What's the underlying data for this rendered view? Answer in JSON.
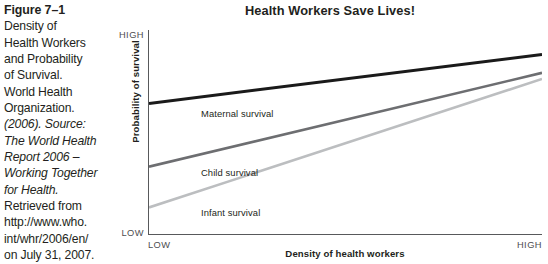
{
  "caption": {
    "figure_number": "Figure 7–1",
    "lines": [
      "Density of",
      "Health Workers",
      "and Probability",
      "of Survival.",
      "World Health",
      "Organization.",
      "(2006). Source:",
      "The World Health",
      "Report 2006 –",
      "Working Together",
      "for Health.",
      "Retrieved from",
      "http://www.who.",
      "int/whr/2006/en/",
      "on July 31, 2007."
    ]
  },
  "chart_data": {
    "type": "line",
    "title": "Health Workers Save Lives!",
    "xlabel": "Density of health workers",
    "ylabel": "Probability of survival",
    "x_tick_labels": [
      "LOW",
      "HIGH"
    ],
    "y_tick_labels": [
      "LOW",
      "HIGH"
    ],
    "xlim": [
      0,
      1
    ],
    "ylim": [
      0,
      1
    ],
    "grid": false,
    "legend": "inline-labels",
    "x": [
      0,
      1
    ],
    "series": [
      {
        "name": "Maternal survival",
        "values": [
          0.64,
          0.88
        ],
        "color": "#1a1a1a",
        "width": 3.0
      },
      {
        "name": "Child survival",
        "values": [
          0.33,
          0.79
        ],
        "color": "#6d6e71",
        "width": 2.6
      },
      {
        "name": "Infant survival",
        "values": [
          0.13,
          0.76
        ],
        "color": "#bcbec0",
        "width": 2.6
      }
    ]
  }
}
